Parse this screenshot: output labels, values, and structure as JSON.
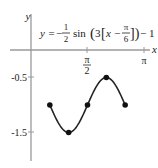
{
  "chart_data": {
    "type": "line",
    "equation": {
      "lhs": "y =",
      "coef_num": "1",
      "coef_den": "2",
      "func": "sin",
      "inner_prefix": "3",
      "inner_x": "x −",
      "shift_num": "π",
      "shift_den": "6",
      "tail": "− 1"
    },
    "xlabel": "x",
    "ylabel": "y",
    "x_ticks": [
      {
        "value": 1.5708,
        "num": "π",
        "den": "2"
      },
      {
        "value": 3.1416,
        "label": "π"
      }
    ],
    "y_ticks": [
      {
        "value": -0.5,
        "label": "-0.5"
      },
      {
        "value": -1.5,
        "label": "-1.5"
      }
    ],
    "xlim": [
      0,
      3.1416
    ],
    "ylim": [
      -2,
      0
    ],
    "grid": false,
    "points": [
      {
        "x": 0.5236,
        "y": -1,
        "label": "π/6"
      },
      {
        "x": 1.0472,
        "y": -1.5,
        "label": "π/3"
      },
      {
        "x": 1.5708,
        "y": -1,
        "label": "π/2"
      },
      {
        "x": 2.0944,
        "y": -0.5,
        "label": "2π/3"
      },
      {
        "x": 2.618,
        "y": -1,
        "label": "5π/6"
      }
    ],
    "series": [
      {
        "name": "y = -1/2 sin(3(x - π/6)) - 1",
        "x_range": [
          0.5236,
          2.618
        ]
      }
    ],
    "colors": {
      "curve": "#222222",
      "axis": "#9a9a9a"
    }
  }
}
